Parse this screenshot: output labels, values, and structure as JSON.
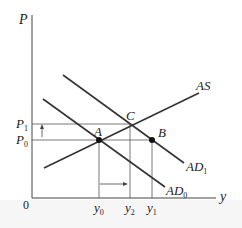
{
  "diagram": {
    "type": "economics-ad-as",
    "axes": {
      "y_label": "P",
      "x_label": "y",
      "origin_label": "0"
    },
    "curves": [
      {
        "id": "AS",
        "label": "AS",
        "slope": "upward"
      },
      {
        "id": "AD0",
        "label": "AD",
        "sub": "0",
        "slope": "downward"
      },
      {
        "id": "AD1",
        "label": "AD",
        "sub": "1",
        "slope": "downward"
      }
    ],
    "points": [
      {
        "label": "A",
        "filled": true
      },
      {
        "label": "B",
        "filled": true
      },
      {
        "label": "C",
        "filled": false
      }
    ],
    "price_levels": [
      {
        "label": "P",
        "sub": "1"
      },
      {
        "label": "P",
        "sub": "0"
      }
    ],
    "output_levels": [
      {
        "label": "y",
        "sub": "0"
      },
      {
        "label": "y",
        "sub": "2"
      },
      {
        "label": "y",
        "sub": "1"
      }
    ],
    "colors": {
      "line": "#333333",
      "guide": "#555555",
      "point": "#111111"
    }
  }
}
